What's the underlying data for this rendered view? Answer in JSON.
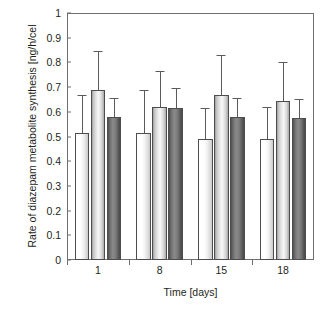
{
  "chart_data": {
    "type": "bar",
    "title": "",
    "xlabel": "Time [days]",
    "ylabel": "Rate of diazepam metabolite synthesis [ng/h/cel",
    "categories": [
      "1",
      "8",
      "15",
      "18"
    ],
    "ylim": [
      0,
      1
    ],
    "yticks": [
      "0",
      "0.1",
      "0.2",
      "0.3",
      "0.4",
      "0.5",
      "0.6",
      "0.7",
      "0.8",
      "0.9",
      "1"
    ],
    "ytick_values": [
      0,
      0.1,
      0.2,
      0.3,
      0.4,
      0.5,
      0.6,
      0.7,
      0.8,
      0.9,
      1
    ],
    "grid": false,
    "legend": "none",
    "error_bars": "upper-only",
    "series": [
      {
        "name": "white",
        "fill": "white",
        "values": [
          0.515,
          0.515,
          0.49,
          0.49
        ],
        "errors": [
          0.155,
          0.175,
          0.125,
          0.13
        ]
      },
      {
        "name": "light-gray",
        "fill": "light-gray",
        "values": [
          0.69,
          0.62,
          0.67,
          0.645
        ],
        "errors": [
          0.155,
          0.145,
          0.16,
          0.155
        ]
      },
      {
        "name": "dark-gray",
        "fill": "dark-gray",
        "values": [
          0.58,
          0.615,
          0.58,
          0.575
        ],
        "errors": [
          0.075,
          0.08,
          0.075,
          0.075
        ]
      }
    ]
  }
}
